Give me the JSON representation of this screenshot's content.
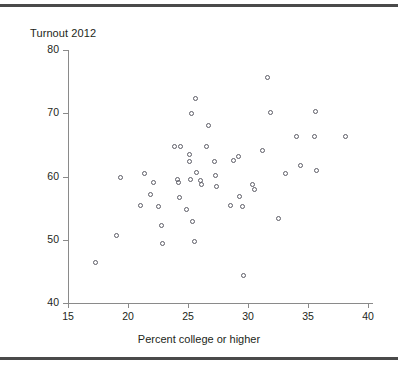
{
  "figure": {
    "title": "Turnout 2012",
    "rules": {
      "color": "#4a4a4a"
    }
  },
  "chart_data": {
    "type": "scatter",
    "title": "Turnout 2012",
    "xlabel": "Percent college or higher",
    "ylabel": "Turnout 2012",
    "xlim": [
      13.5,
      38.9
    ],
    "ylim": [
      38.8,
      80
    ],
    "xticks": [
      15,
      20,
      25,
      30,
      35,
      40
    ],
    "xtick_labels": [
      "15",
      "20",
      "25",
      "30",
      "35",
      "40"
    ],
    "yticks": [
      40,
      50,
      60,
      70,
      80
    ],
    "ytick_labels": [
      "40",
      "50",
      "60",
      "70",
      "80"
    ],
    "grid": false,
    "legend": null,
    "marker": "open-circle",
    "marker_color": "#5c5c66",
    "points": [
      {
        "x": 17.3,
        "y": 46.4
      },
      {
        "x": 19.0,
        "y": 50.6
      },
      {
        "x": 19.4,
        "y": 59.8
      },
      {
        "x": 21.0,
        "y": 55.4
      },
      {
        "x": 21.4,
        "y": 60.5
      },
      {
        "x": 21.9,
        "y": 57.2
      },
      {
        "x": 22.1,
        "y": 59.0
      },
      {
        "x": 22.5,
        "y": 55.2
      },
      {
        "x": 22.8,
        "y": 52.2
      },
      {
        "x": 22.9,
        "y": 49.4
      },
      {
        "x": 23.9,
        "y": 64.8
      },
      {
        "x": 24.1,
        "y": 59.5
      },
      {
        "x": 24.2,
        "y": 59.1
      },
      {
        "x": 24.3,
        "y": 56.7
      },
      {
        "x": 24.4,
        "y": 64.8
      },
      {
        "x": 24.9,
        "y": 54.8
      },
      {
        "x": 25.1,
        "y": 63.5
      },
      {
        "x": 25.1,
        "y": 62.4
      },
      {
        "x": 25.2,
        "y": 59.5
      },
      {
        "x": 25.3,
        "y": 69.9
      },
      {
        "x": 25.4,
        "y": 52.9
      },
      {
        "x": 25.5,
        "y": 49.7
      },
      {
        "x": 25.6,
        "y": 72.3
      },
      {
        "x": 25.7,
        "y": 60.6
      },
      {
        "x": 26.0,
        "y": 59.4
      },
      {
        "x": 26.1,
        "y": 58.8
      },
      {
        "x": 26.5,
        "y": 64.7
      },
      {
        "x": 26.7,
        "y": 68.1
      },
      {
        "x": 27.2,
        "y": 62.4
      },
      {
        "x": 27.3,
        "y": 60.2
      },
      {
        "x": 27.4,
        "y": 58.4
      },
      {
        "x": 28.5,
        "y": 55.4
      },
      {
        "x": 28.8,
        "y": 62.6
      },
      {
        "x": 29.2,
        "y": 63.2
      },
      {
        "x": 29.3,
        "y": 56.9
      },
      {
        "x": 29.5,
        "y": 55.2
      },
      {
        "x": 29.6,
        "y": 44.3
      },
      {
        "x": 30.4,
        "y": 58.8
      },
      {
        "x": 30.5,
        "y": 57.9
      },
      {
        "x": 31.2,
        "y": 64.1
      },
      {
        "x": 31.6,
        "y": 75.7
      },
      {
        "x": 31.9,
        "y": 70.1
      },
      {
        "x": 32.5,
        "y": 53.3
      },
      {
        "x": 33.1,
        "y": 60.5
      },
      {
        "x": 34.0,
        "y": 66.4
      },
      {
        "x": 34.4,
        "y": 61.8
      },
      {
        "x": 35.5,
        "y": 66.3
      },
      {
        "x": 35.6,
        "y": 70.3
      },
      {
        "x": 35.7,
        "y": 61.0
      },
      {
        "x": 38.1,
        "y": 66.3
      }
    ]
  }
}
